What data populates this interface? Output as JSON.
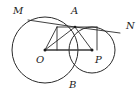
{
  "figure": {
    "type": "geometry-diagram",
    "canvas": {
      "width": 140,
      "height": 94
    },
    "stroke_color": "#2b2b2b",
    "label_color": "#1a1a1a",
    "background_color": "#ffffff"
  },
  "labels": {
    "M": "M",
    "A": "A",
    "N": "N",
    "O": "O",
    "P": "P",
    "B": "B"
  },
  "points": {
    "M": {
      "x": 28,
      "y": 20,
      "label_x": 13,
      "label_y": 14
    },
    "A": {
      "x": 75,
      "y": 27,
      "label_x": 71,
      "label_y": 14
    },
    "N": {
      "x": 120,
      "y": 33,
      "label_x": 126,
      "label_y": 29
    },
    "O": {
      "x": 45,
      "y": 50,
      "label_x": 38,
      "label_y": 62
    },
    "P": {
      "x": 92,
      "y": 50,
      "label_x": 96,
      "label_y": 62
    },
    "B": {
      "x": 73,
      "y": 73,
      "label_x": 70,
      "label_y": 87
    },
    "foot_left": {
      "x": 57,
      "y": 27
    },
    "foot_left_base": {
      "x": 57,
      "y": 50
    },
    "foot_right": {
      "x": 97,
      "y": 27
    },
    "foot_right_base": {
      "x": 97,
      "y": 50
    }
  },
  "circles": [
    {
      "name": "circle-O",
      "cx": 45,
      "cy": 50,
      "r": 33
    },
    {
      "name": "circle-P",
      "cx": 92,
      "cy": 50,
      "r": 23
    }
  ],
  "segments": [
    {
      "name": "segment-M-A",
      "from": "M",
      "to": "A"
    },
    {
      "name": "segment-A-N",
      "from": "A",
      "to": "N"
    },
    {
      "name": "segment-O-P",
      "from": "O",
      "to": "P"
    },
    {
      "name": "segment-O-A",
      "from": "O",
      "to": "A"
    },
    {
      "name": "segment-P-A",
      "from": "P",
      "to": "A"
    },
    {
      "name": "segment-A-foot-left",
      "from": "A",
      "to": "foot_left"
    },
    {
      "name": "segment-foot-left-vertical",
      "from": "foot_left",
      "to": "foot_left_base"
    },
    {
      "name": "segment-O-foot-left",
      "from": "O",
      "to": "foot_left"
    },
    {
      "name": "segment-A-foot-right",
      "from": "A",
      "to": "foot_right"
    },
    {
      "name": "segment-foot-right-vertical",
      "from": "foot_right",
      "to": "foot_right_base"
    }
  ]
}
